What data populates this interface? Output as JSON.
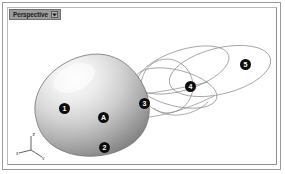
{
  "window": {
    "title": "Perspective",
    "background_color": "#ffffff",
    "frame_color": "#9a9a9a"
  },
  "viewport": {
    "label": "Perspective",
    "label_caret_icon": "dropdown-caret-icon",
    "label_background": "#9b9b9b",
    "shading_mode": "smooth-shaded"
  },
  "axis_gizmo": {
    "name": "world-axis-tripod",
    "axes": [
      {
        "id": "z",
        "label": "z"
      },
      {
        "id": "x",
        "label": "x"
      },
      {
        "id": "y",
        "label": "y"
      }
    ],
    "color": "#3a3a3a"
  },
  "objects": {
    "blob": {
      "name": "shaded-blob-surface",
      "highlight_color": "#fdfdfd",
      "midtone_color": "#c9c9c9",
      "shadow_color": "#8d8d8d",
      "outline_color": "#6f6f6f"
    },
    "splines": {
      "name": "wireframe-spline-curves",
      "stroke_color": "#8a8a8a",
      "count": 3
    }
  },
  "markers": [
    {
      "id": "marker-1",
      "label": "1",
      "x": 51,
      "y": 95,
      "target": "blob-left-lobe"
    },
    {
      "id": "marker-2",
      "label": "2",
      "x": 91,
      "y": 134,
      "target": "blob-lower-front"
    },
    {
      "id": "marker-3",
      "label": "3",
      "x": 131,
      "y": 90,
      "target": "blob-upper-right-edge"
    },
    {
      "id": "marker-4",
      "label": "4",
      "x": 177,
      "y": 73,
      "target": "spline-mid-crossing"
    },
    {
      "id": "marker-5",
      "label": "5",
      "x": 232,
      "y": 51,
      "target": "spline-right-loop"
    },
    {
      "id": "marker-a",
      "label": "A",
      "x": 90,
      "y": 104,
      "target": "blob-center-face"
    }
  ]
}
